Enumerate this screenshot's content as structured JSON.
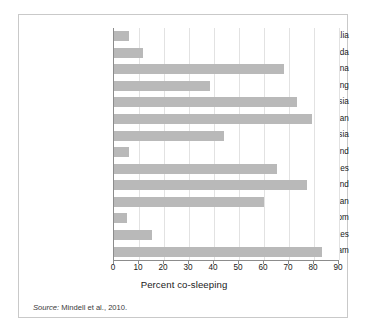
{
  "figure": {
    "source_prefix": "Source:",
    "source_text": " Mindell et al., 2010."
  },
  "chart_data": {
    "type": "bar",
    "orientation": "horizontal",
    "title": "",
    "xlabel": "Percent co-sleeping",
    "ylabel": "",
    "xlim": [
      0,
      90
    ],
    "xticks": [
      0,
      10,
      20,
      30,
      40,
      50,
      60,
      70,
      80,
      90
    ],
    "xtick_labels": [
      "0",
      "10",
      "20",
      "30",
      "40",
      "50",
      "60",
      "70",
      "80",
      "90"
    ],
    "grid": true,
    "legend": false,
    "bar_color": "#b9b9b9",
    "categories": [
      "Australia",
      "Canada",
      "China",
      "Hong Kong",
      "Indonesia",
      "Japan",
      "Malaysia",
      "New Zealand",
      "Philippines",
      "Thailand",
      "Taiwan",
      "United Kingdom",
      "United  States",
      "Vietnam"
    ],
    "values": [
      6,
      11.5,
      68,
      38.5,
      73,
      79,
      44,
      6,
      65,
      77,
      60,
      5,
      15,
      83
    ]
  }
}
